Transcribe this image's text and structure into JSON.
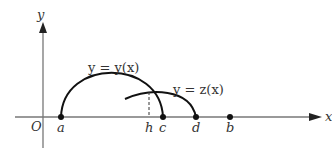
{
  "diagram": {
    "axes": {
      "x_label": "x",
      "y_label": "y",
      "origin_label": "O"
    },
    "points": [
      {
        "name": "a",
        "label": "a"
      },
      {
        "name": "h",
        "label": "h"
      },
      {
        "name": "c",
        "label": "c"
      },
      {
        "name": "d",
        "label": "d"
      },
      {
        "name": "b",
        "label": "b"
      }
    ],
    "curves": [
      {
        "name": "y-curve",
        "label": "y = y(x)"
      },
      {
        "name": "z-curve",
        "label": "y = z(x)"
      }
    ],
    "colors": {
      "axis": "#777777",
      "curve": "#111111",
      "text": "#333333"
    }
  }
}
